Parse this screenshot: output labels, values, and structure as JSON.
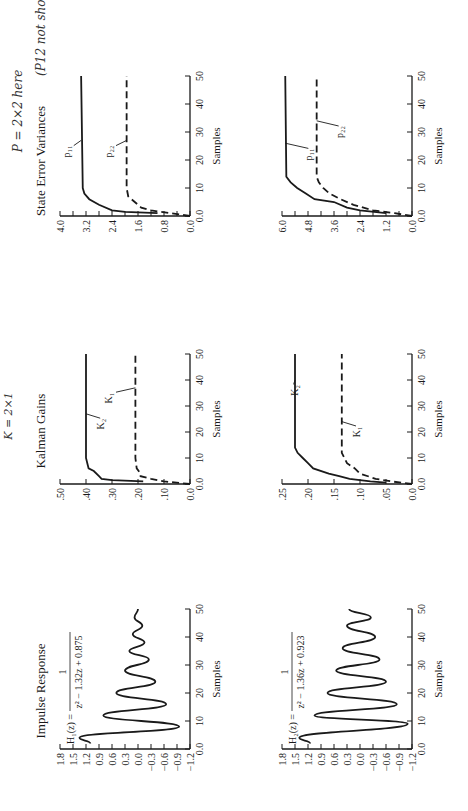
{
  "annotations": {
    "gain_note": "K = 2×1",
    "variance_note": "P = 2×2 here",
    "variance_title_note": "(P12 not shown)"
  },
  "columns": {
    "impulse": {
      "title": "Impulse Response"
    },
    "gains": {
      "title": "Kalman Gains"
    },
    "variances": {
      "title": "State Error Variances"
    }
  },
  "chart_data": [
    {
      "id": "impulse-h1",
      "type": "line",
      "title": "Impulse Response",
      "equation": "H1(z) = 1 / (z^2 - 1.32z + 0.875)",
      "equation_lhs": "H₁(z) =",
      "equation_num": "1",
      "equation_den": "z² − 1.32z + 0.875",
      "xlabel": "Samples",
      "xlim": [
        0,
        50
      ],
      "xticks": [
        0,
        10,
        20,
        30,
        40,
        50
      ],
      "xtick_labels": [
        "0.0",
        "10",
        "20",
        "30",
        "40",
        "50"
      ],
      "ylim": [
        -1.2,
        1.8
      ],
      "yticks": [
        -1.2,
        -0.9,
        -0.6,
        -0.3,
        0.0,
        0.3,
        0.6,
        0.9,
        1.2,
        1.5,
        1.8
      ],
      "ytick_labels": [
        "−1.2",
        "−0.9",
        "−0.6",
        "−0.3",
        "0.0",
        "0.3",
        "0.6",
        "0.9",
        "1.2",
        "1.5",
        "1.8"
      ],
      "series": [
        {
          "name": "h1",
          "style": "solid",
          "x": [
            2,
            4,
            8,
            12,
            16,
            20,
            24,
            28,
            32,
            35,
            38,
            41,
            44,
            47,
            50
          ],
          "y": [
            1.1,
            1.35,
            -0.95,
            0.8,
            -0.65,
            0.5,
            -0.4,
            0.3,
            -0.25,
            0.2,
            -0.15,
            0.12,
            -0.1,
            0.08,
            0.0
          ]
        }
      ]
    },
    {
      "id": "impulse-h2",
      "type": "line",
      "title": "",
      "equation": "H2(z) = 1 / (z^2 - 1.36z + 0.923)",
      "equation_lhs": "H₂(z) =",
      "equation_num": "1",
      "equation_den": "z² − 1.36z + 0.923",
      "xlabel": "Samples",
      "xlim": [
        0,
        50
      ],
      "xticks": [
        0,
        10,
        20,
        30,
        40,
        50
      ],
      "xtick_labels": [
        "0.0",
        "10",
        "20",
        "30",
        "40",
        "50"
      ],
      "ylim": [
        -1.2,
        1.8
      ],
      "yticks": [
        -1.2,
        -0.9,
        -0.6,
        -0.3,
        0.0,
        0.3,
        0.6,
        0.9,
        1.2,
        1.5,
        1.8
      ],
      "ytick_labels": [
        "−1.2",
        "−0.9",
        "−0.6",
        "−0.3",
        "0.0",
        "0.3",
        "0.6",
        "0.9",
        "1.2",
        "1.5",
        "1.8"
      ],
      "series": [
        {
          "name": "h2",
          "style": "solid",
          "x": [
            2,
            4,
            9,
            12,
            16,
            20,
            24,
            28,
            32,
            36,
            40,
            44,
            47,
            50
          ],
          "y": [
            1.15,
            1.4,
            -1.1,
            1.05,
            -0.85,
            0.75,
            -0.6,
            0.55,
            -0.45,
            0.4,
            -0.35,
            0.3,
            -0.25,
            0.25
          ]
        }
      ]
    },
    {
      "id": "gains-h1",
      "type": "line",
      "title": "Kalman Gains",
      "xlabel": "Samples",
      "xlim": [
        0,
        50
      ],
      "xticks": [
        0,
        10,
        20,
        30,
        40,
        50
      ],
      "xtick_labels": [
        "0.0",
        "10",
        "20",
        "30",
        "40",
        "50"
      ],
      "ylim": [
        0,
        0.5
      ],
      "yticks": [
        0,
        0.1,
        0.2,
        0.3,
        0.4,
        0.5
      ],
      "ytick_labels": [
        "0.0",
        ".10",
        ".20",
        ".30",
        ".40",
        ".50"
      ],
      "series": [
        {
          "name": "K₂",
          "style": "solid",
          "x": [
            1,
            1.5,
            2,
            3,
            5,
            6,
            8,
            10,
            50
          ],
          "y": [
            0.18,
            0.3,
            0.34,
            0.35,
            0.37,
            0.39,
            0.395,
            0.4,
            0.4
          ]
        },
        {
          "name": "K₁",
          "style": "dashed",
          "x": [
            0,
            1,
            2,
            3,
            4,
            6,
            10,
            50
          ],
          "y": [
            0.0,
            0.1,
            0.15,
            0.19,
            0.19,
            0.205,
            0.21,
            0.21
          ]
        }
      ],
      "labels": [
        {
          "text": "K₂",
          "x": 23,
          "y": 0.33
        },
        {
          "text": "K₁",
          "x": 33,
          "y": 0.3
        }
      ]
    },
    {
      "id": "gains-h2",
      "type": "line",
      "title": "",
      "xlabel": "Samples",
      "xlim": [
        0,
        50
      ],
      "xticks": [
        0,
        10,
        20,
        30,
        40,
        50
      ],
      "xtick_labels": [
        "0.0",
        "10",
        "20",
        "30",
        "40",
        "50"
      ],
      "ylim": [
        0,
        0.25
      ],
      "yticks": [
        0,
        0.05,
        0.1,
        0.15,
        0.2,
        0.25
      ],
      "ytick_labels": [
        "0.0",
        ".05",
        ".10",
        ".15",
        ".20",
        ".25"
      ],
      "series": [
        {
          "name": "K₂",
          "style": "solid",
          "x": [
            0.5,
            1,
            2,
            3,
            4,
            6,
            8,
            10,
            12,
            14,
            50
          ],
          "y": [
            0.05,
            0.08,
            0.12,
            0.14,
            0.16,
            0.19,
            0.2,
            0.21,
            0.22,
            0.225,
            0.225
          ]
        },
        {
          "name": "K₁",
          "style": "dashed",
          "x": [
            0,
            1,
            2,
            4,
            6,
            8,
            10,
            12,
            50
          ],
          "y": [
            0.0,
            0.04,
            0.07,
            0.1,
            0.11,
            0.125,
            0.13,
            0.135,
            0.135
          ]
        }
      ],
      "labels": [
        {
          "text": "K₂",
          "x": 36,
          "y": 0.22
        },
        {
          "text": "K₁",
          "x": 20,
          "y": 0.1
        }
      ]
    },
    {
      "id": "variances-h1",
      "type": "line",
      "title": "State Error Variances",
      "xlabel": "Samples",
      "xlim": [
        0,
        50
      ],
      "xticks": [
        0,
        10,
        20,
        30,
        40,
        50
      ],
      "xtick_labels": [
        "0.0",
        "10",
        "20",
        "30",
        "40",
        "50"
      ],
      "ylim": [
        0,
        4.0
      ],
      "yticks": [
        0,
        0.4,
        0.8,
        1.2,
        1.6,
        2.0,
        2.4,
        2.8,
        3.2,
        3.6,
        4.0
      ],
      "ytick_labels": [
        "0.0",
        "",
        "0.8",
        "",
        "1.6",
        "",
        "2.4",
        "",
        "3.2",
        "",
        "4.0"
      ],
      "series": [
        {
          "name": "p₁₁",
          "style": "solid",
          "x": [
            1,
            1.5,
            2,
            4,
            6,
            8,
            10,
            50
          ],
          "y": [
            1.0,
            2.0,
            2.4,
            2.8,
            3.1,
            3.25,
            3.3,
            3.35
          ]
        },
        {
          "name": "p₂₂",
          "style": "dashed",
          "x": [
            0,
            1,
            2,
            3,
            5,
            7,
            10,
            50
          ],
          "y": [
            0.0,
            0.6,
            1.2,
            1.5,
            1.7,
            1.9,
            1.95,
            1.95
          ]
        }
      ],
      "labels": [
        {
          "text": "p₁₁",
          "x": 23,
          "y": 3.7
        },
        {
          "text": "p₂₂",
          "x": 23,
          "y": 2.4
        }
      ]
    },
    {
      "id": "variances-h2",
      "type": "line",
      "title": "",
      "xlabel": "Samples",
      "xlim": [
        0,
        50
      ],
      "xticks": [
        0,
        10,
        20,
        30,
        40,
        50
      ],
      "xtick_labels": [
        "0.0",
        "10",
        "20",
        "30",
        "40",
        "50"
      ],
      "ylim": [
        0,
        6.0
      ],
      "yticks": [
        0,
        0.6,
        1.2,
        1.8,
        2.4,
        3.0,
        3.6,
        4.2,
        4.8,
        5.4,
        6.0
      ],
      "ytick_labels": [
        "0.0",
        "",
        "1.2",
        "",
        "2.4",
        "",
        "3.6",
        "",
        "4.8",
        "",
        "6.0"
      ],
      "series": [
        {
          "name": "p₁₁",
          "style": "solid",
          "x": [
            1,
            2,
            3,
            5,
            6,
            8,
            10,
            12,
            14,
            50
          ],
          "y": [
            1.2,
            2.4,
            3.0,
            3.6,
            4.5,
            4.9,
            5.3,
            5.6,
            5.8,
            5.85
          ]
        },
        {
          "name": "p₂₂",
          "style": "dashed",
          "x": [
            0,
            1,
            2,
            4,
            6,
            8,
            10,
            12,
            14,
            50
          ],
          "y": [
            0.0,
            0.8,
            1.8,
            2.7,
            3.3,
            3.8,
            4.1,
            4.3,
            4.4,
            4.4
          ]
        }
      ],
      "labels": [
        {
          "text": "p₁₁",
          "x": 22,
          "y": 4.6
        },
        {
          "text": "p₂₂",
          "x": 30,
          "y": 3.2
        }
      ]
    }
  ]
}
